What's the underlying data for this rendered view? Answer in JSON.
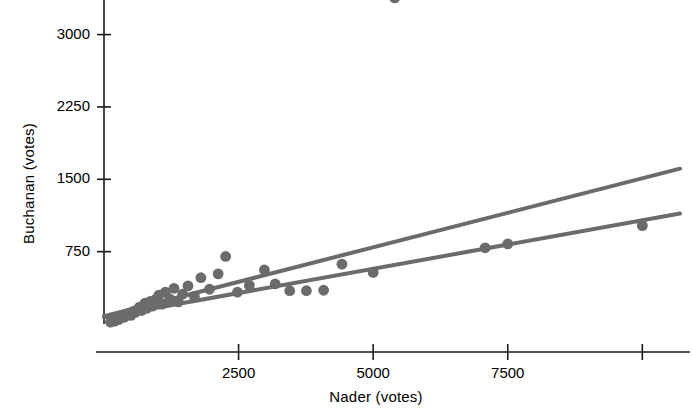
{
  "chart_data": {
    "type": "scatter",
    "title": "",
    "xlabel": "Nader (votes)",
    "ylabel": "Buchanan (votes)",
    "xlim": [
      0,
      10700
    ],
    "ylim": [
      0,
      3400
    ],
    "xticks": [
      2500,
      5000,
      7500,
      10000
    ],
    "xtick_labels": [
      "2500",
      "5000",
      "7500",
      ""
    ],
    "yticks": [
      750,
      1500,
      2250,
      3000
    ],
    "ytick_labels": [
      "750",
      "1500",
      "2250",
      "3000"
    ],
    "grid": false,
    "legend": "none",
    "marker_color": "#6b6b6b",
    "line_color": "#6b6b6b",
    "axis_color": "#1a1a1a",
    "background": "#ffffff",
    "points": [
      [
        120,
        20
      ],
      [
        170,
        35
      ],
      [
        200,
        30
      ],
      [
        240,
        55
      ],
      [
        270,
        45
      ],
      [
        300,
        60
      ],
      [
        340,
        75
      ],
      [
        380,
        70
      ],
      [
        420,
        95
      ],
      [
        460,
        110
      ],
      [
        500,
        90
      ],
      [
        540,
        130
      ],
      [
        580,
        120
      ],
      [
        620,
        150
      ],
      [
        660,
        175
      ],
      [
        700,
        140
      ],
      [
        760,
        215
      ],
      [
        800,
        165
      ],
      [
        860,
        235
      ],
      [
        900,
        185
      ],
      [
        960,
        255
      ],
      [
        1020,
        300
      ],
      [
        1080,
        205
      ],
      [
        1140,
        330
      ],
      [
        1220,
        260
      ],
      [
        1300,
        370
      ],
      [
        1380,
        230
      ],
      [
        1460,
        310
      ],
      [
        1560,
        395
      ],
      [
        1680,
        285
      ],
      [
        1800,
        480
      ],
      [
        1960,
        360
      ],
      [
        2120,
        520
      ],
      [
        2260,
        700
      ],
      [
        2480,
        330
      ],
      [
        2700,
        400
      ],
      [
        2980,
        560
      ],
      [
        3180,
        415
      ],
      [
        3450,
        345
      ],
      [
        3760,
        345
      ],
      [
        4080,
        350
      ],
      [
        4420,
        620
      ],
      [
        5000,
        535
      ],
      [
        5400,
        3380
      ],
      [
        7080,
        790
      ],
      [
        7500,
        830
      ],
      [
        10000,
        1020
      ]
    ],
    "fit_lines": [
      {
        "name": "with-outlier-fit",
        "x_start": 0,
        "y_start": 80,
        "x_end": 10700,
        "y_end": 1610
      },
      {
        "name": "without-outlier-fit",
        "x_start": 0,
        "y_start": 70,
        "x_end": 10700,
        "y_end": 1145
      }
    ]
  }
}
